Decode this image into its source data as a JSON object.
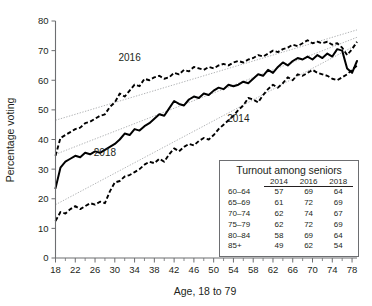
{
  "chart_data": {
    "type": "line",
    "title": "",
    "xlabel": "Age, 18 to 79",
    "ylabel": "Percentage voting",
    "xlim": [
      18,
      79
    ],
    "ylim": [
      0,
      80
    ],
    "yticks": [
      0,
      10,
      20,
      30,
      40,
      50,
      60,
      70,
      80
    ],
    "xticks": [
      18,
      22,
      26,
      30,
      34,
      38,
      42,
      46,
      50,
      54,
      58,
      62,
      66,
      70,
      74,
      78
    ],
    "xticks_minor_step": 2,
    "grid": false,
    "legend": "inline-labels",
    "x": [
      18,
      19,
      20,
      21,
      22,
      23,
      24,
      25,
      26,
      27,
      28,
      29,
      30,
      31,
      32,
      33,
      34,
      35,
      36,
      37,
      38,
      39,
      40,
      41,
      42,
      43,
      44,
      45,
      46,
      47,
      48,
      49,
      50,
      51,
      52,
      53,
      54,
      55,
      56,
      57,
      58,
      59,
      60,
      61,
      62,
      63,
      64,
      65,
      66,
      67,
      68,
      69,
      70,
      71,
      72,
      73,
      74,
      75,
      76,
      77,
      78,
      79
    ],
    "series": [
      {
        "name": "2016",
        "style": "dashed",
        "label_x": 33,
        "label_y": 66.5,
        "values": [
          34.5,
          40.5,
          41.5,
          42.5,
          43.5,
          44.0,
          45.5,
          46.0,
          47.0,
          48.0,
          48.5,
          51.0,
          52.5,
          55.5,
          54.5,
          56.5,
          58.5,
          58.0,
          60.5,
          60.0,
          61.0,
          61.5,
          60.5,
          61.0,
          62.5,
          62.0,
          63.5,
          63.0,
          64.5,
          64.0,
          63.5,
          64.5,
          64.0,
          65.0,
          65.5,
          65.0,
          66.0,
          66.5,
          66.0,
          67.0,
          67.5,
          68.5,
          68.0,
          69.0,
          70.0,
          69.5,
          70.5,
          71.0,
          72.0,
          71.5,
          72.5,
          73.5,
          72.5,
          73.0,
          72.5,
          73.0,
          72.0,
          72.5,
          71.0,
          68.5,
          70.5,
          73.0
        ]
      },
      {
        "name": "2018",
        "style": "solid",
        "label_x": 28,
        "label_y": 34.5,
        "values": [
          23.5,
          30.5,
          32.5,
          33.5,
          34.5,
          34.0,
          35.5,
          35.0,
          36.0,
          35.5,
          36.5,
          37.5,
          38.5,
          40.0,
          42.0,
          41.5,
          43.5,
          43.0,
          44.5,
          45.5,
          47.0,
          48.5,
          48.0,
          50.5,
          53.0,
          52.0,
          51.5,
          53.5,
          54.5,
          54.0,
          55.5,
          55.0,
          56.5,
          57.5,
          57.0,
          58.5,
          58.0,
          58.5,
          59.5,
          59.0,
          60.5,
          62.0,
          61.5,
          63.5,
          62.5,
          64.5,
          66.0,
          65.0,
          66.5,
          67.5,
          67.0,
          68.0,
          67.0,
          68.5,
          67.5,
          69.0,
          68.0,
          70.5,
          70.0,
          64.0,
          62.5,
          66.5
        ]
      },
      {
        "name": "2014",
        "style": "dashed",
        "label_x": 55,
        "label_y": 46.0,
        "values": [
          12.5,
          15.5,
          15.0,
          16.5,
          17.5,
          16.5,
          17.5,
          18.5,
          18.0,
          19.0,
          18.5,
          22.5,
          25.5,
          26.0,
          27.5,
          28.0,
          29.0,
          30.0,
          31.5,
          32.5,
          32.0,
          33.5,
          32.5,
          35.0,
          37.0,
          36.0,
          37.5,
          38.5,
          38.0,
          39.5,
          40.5,
          40.0,
          41.5,
          43.5,
          45.0,
          46.5,
          48.0,
          50.0,
          51.5,
          54.0,
          53.5,
          52.5,
          55.0,
          57.0,
          58.5,
          57.5,
          59.0,
          61.0,
          60.0,
          62.0,
          61.5,
          62.5,
          63.5,
          62.5,
          62.0,
          61.5,
          60.5,
          60.0,
          61.0,
          62.0,
          63.5,
          65.0
        ]
      }
    ],
    "trend_lines": [
      {
        "name": "2016-trend",
        "x0": 18,
        "y0": 46.5,
        "x1": 79,
        "y1": 77.0
      },
      {
        "name": "2018-trend",
        "x0": 18,
        "y0": 35.0,
        "x1": 79,
        "y1": 74.5
      },
      {
        "name": "2014-trend",
        "x0": 18,
        "y0": 18.0,
        "x1": 79,
        "y1": 72.0
      }
    ]
  },
  "inset": {
    "title": "Turnout among seniors",
    "corner_header": "",
    "columns": [
      "2014",
      "2016",
      "2018"
    ],
    "rows": [
      {
        "label": "60–64",
        "values": [
          "57",
          "69",
          "64"
        ]
      },
      {
        "label": "65–69",
        "values": [
          "61",
          "72",
          "69"
        ]
      },
      {
        "label": "70–74",
        "values": [
          "62",
          "74",
          "67"
        ]
      },
      {
        "label": "75–79",
        "values": [
          "62",
          "72",
          "69"
        ]
      },
      {
        "label": "80–84",
        "values": [
          "58",
          "69",
          "64"
        ]
      },
      {
        "label": "85+",
        "values": [
          "49",
          "62",
          "54"
        ]
      }
    ]
  },
  "colors": {
    "axis": "#6d6e71",
    "series": "#000000",
    "trend": "#a7a9ac",
    "text": "#231f20",
    "background": "#ffffff"
  }
}
